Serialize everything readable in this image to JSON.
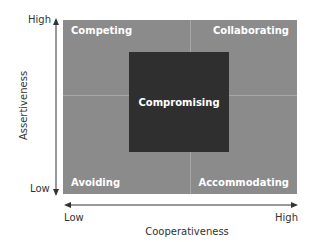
{
  "diagram": {
    "type": "quadrant",
    "quadrants": {
      "top_left": "Competing",
      "top_right": "Collaborating",
      "bottom_left": "Avoiding",
      "bottom_right": "Accommodating",
      "center": "Compromising"
    },
    "y_axis": {
      "label": "Assertiveness",
      "low": "Low",
      "high": "High"
    },
    "x_axis": {
      "label": "Cooperativeness",
      "low": "Low",
      "high": "High"
    },
    "colors": {
      "quadrant_fill": "#8b8b8b",
      "center_fill": "#2f2f2f",
      "divider": "#a7a7a7",
      "label_text": "#ffffff",
      "axis": "#333333"
    }
  }
}
